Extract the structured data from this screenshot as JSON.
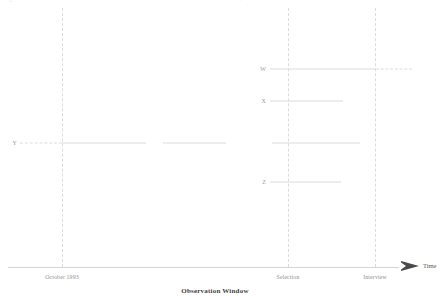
{
  "figure": {
    "caption": "Observation Window",
    "axis": {
      "label": "Time",
      "arrow_icon": "right-arrow-icon"
    },
    "ticks": [
      {
        "id": "october-1993",
        "label": "October 1993",
        "x": 62
      },
      {
        "id": "selection",
        "label": "Selection",
        "x": 288
      },
      {
        "id": "interview",
        "label": "Interview",
        "x": 375
      }
    ],
    "top_fragments": [
      {
        "id": "fragment-left",
        "text": "C"
      },
      {
        "id": "fragment-mid",
        "text": "4"
      }
    ]
  },
  "chart_data": {
    "type": "timeline",
    "title": "Observation Window",
    "xlabel": "Time",
    "ylabel": "",
    "grid": true,
    "legend": "none",
    "xlim": [
      8,
      420
    ],
    "event_markers": [
      {
        "name": "October 1993",
        "x": 62,
        "style": "dashed-vertical"
      },
      {
        "name": "Selection",
        "x": 288,
        "style": "dashed-vertical"
      },
      {
        "name": "Interview",
        "x": 375,
        "style": "dashed-vertical"
      }
    ],
    "series": [
      {
        "name": "W",
        "label": "W",
        "y": 69,
        "label_x": 266,
        "segments": [
          {
            "x_start": 270,
            "x_end": 375,
            "style": "solid"
          },
          {
            "x_start": 376,
            "x_end": 412,
            "style": "dashed"
          }
        ]
      },
      {
        "name": "X",
        "label": "X",
        "y": 101,
        "label_x": 266,
        "segments": [
          {
            "x_start": 270,
            "x_end": 343,
            "style": "solid"
          }
        ]
      },
      {
        "name": "Y",
        "label": "Y",
        "y": 143,
        "label_x": 17,
        "segments": [
          {
            "x_start": 20,
            "x_end": 62,
            "style": "dashed"
          },
          {
            "x_start": 62,
            "x_end": 146,
            "style": "solid"
          },
          {
            "x_start": 163,
            "x_end": 226,
            "style": "solid"
          },
          {
            "x_start": 272,
            "x_end": 360,
            "style": "solid"
          }
        ]
      },
      {
        "name": "Z",
        "label": "Z",
        "y": 182,
        "label_x": 266,
        "segments": [
          {
            "x_start": 270,
            "x_end": 341,
            "style": "solid"
          }
        ]
      }
    ]
  }
}
